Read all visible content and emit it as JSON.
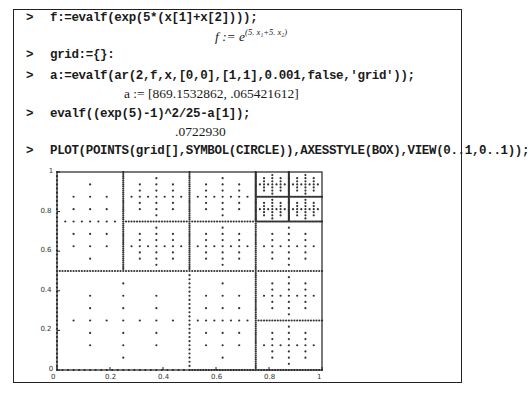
{
  "worksheet": {
    "prompt_symbol": ">",
    "lines": [
      {
        "input": "f:=evalf(exp(5*(x[1]+x[2])));",
        "output_prefix": "f := e",
        "output_sup": "(5. x₁+5. x₂)"
      },
      {
        "input": "grid:={}:",
        "output": null
      },
      {
        "input": "a:=evalf(ar(2,f,x,[0,0],[1,1],0.001,false,'grid'));",
        "output": "a := [869.1532862, .065421612]"
      },
      {
        "input": "evalf((exp(5)-1)^2/25-a[1]);",
        "output": ".0722930"
      },
      {
        "input": "PLOT(POINTS(grid[],SYMBOL(CIRCLE)),AXESSTYLE(BOX),VIEW(0..1,0..1));",
        "output": null
      }
    ]
  },
  "chart_data": {
    "type": "scatter",
    "title": "",
    "xlabel": "",
    "ylabel": "",
    "xlim": [
      0,
      1
    ],
    "ylim": [
      0,
      1
    ],
    "axes_style": "box",
    "symbol": "circle",
    "grid": false,
    "legend": null,
    "x_ticks": [
      "0",
      "0.2",
      "0.4",
      "0.6",
      "0.8",
      "1"
    ],
    "y_ticks": [
      "0",
      "0.2",
      "0.4",
      "0.6",
      "0.8",
      "1"
    ],
    "leaf_cells": [
      [
        0,
        0,
        0.5,
        0.5
      ],
      [
        0,
        0.5,
        0.25,
        1
      ],
      [
        0.25,
        0.5,
        0.5,
        0.75
      ],
      [
        0.25,
        0.75,
        0.5,
        1
      ],
      [
        0.5,
        0,
        0.75,
        0.5
      ],
      [
        0.75,
        0,
        1,
        0.25
      ],
      [
        0.75,
        0.25,
        1,
        0.5
      ],
      [
        0.5,
        0.5,
        0.75,
        0.75
      ],
      [
        0.75,
        0.5,
        1,
        0.75
      ],
      [
        0.5,
        0.75,
        0.75,
        1
      ],
      [
        0.75,
        0.75,
        0.875,
        0.875
      ],
      [
        0.875,
        0.75,
        1,
        0.875
      ],
      [
        0.75,
        0.875,
        0.875,
        1
      ],
      [
        0.875,
        0.875,
        1,
        1
      ]
    ]
  }
}
